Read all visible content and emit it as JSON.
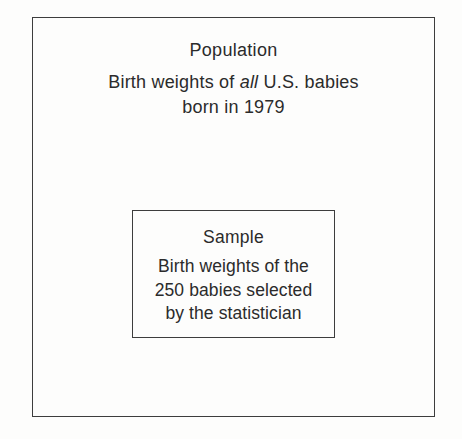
{
  "population": {
    "title": "Population",
    "desc_line1_pre": "Birth weights of ",
    "desc_line1_italic": "all",
    "desc_line1_post": " U.S. babies",
    "desc_line2": "born in 1979"
  },
  "sample": {
    "title": "Sample",
    "desc_line1": "Birth weights of the",
    "desc_line2": "250 babies selected",
    "desc_line3": "by the statistician"
  },
  "colors": {
    "background": "#fdfdfc",
    "border": "#3d3d3d",
    "text": "#2b2b2b"
  }
}
